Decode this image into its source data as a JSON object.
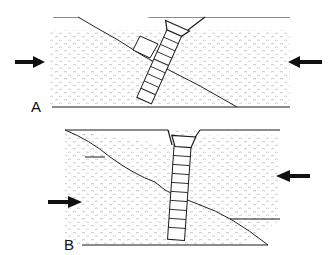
{
  "panels": [
    {
      "label": "A",
      "description": "Screw inserted obliquely across fracture line; compression arrows from left and right"
    },
    {
      "label": "B",
      "description": "Screw inserted perpendicular; fracture fragments shift under compression"
    }
  ],
  "colors": {
    "line": "#1a1a1a",
    "stipple": "#9a9a9a",
    "background": "#ffffff"
  }
}
